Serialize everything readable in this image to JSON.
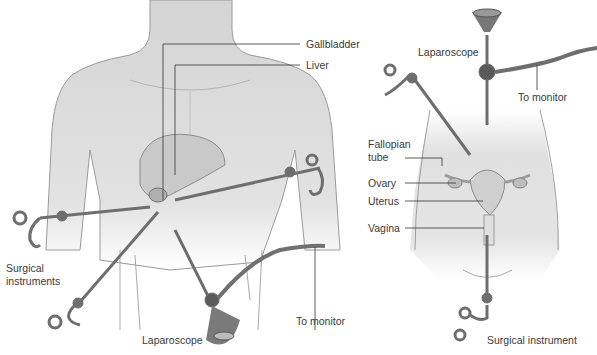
{
  "left_panel": {
    "labels": {
      "gallbladder": "Gallbladder",
      "liver": "Liver",
      "surgical_instruments_line1": "Surgical",
      "surgical_instruments_line2": "instruments",
      "laparoscope": "Laparoscope",
      "to_monitor": "To monitor"
    }
  },
  "right_panel": {
    "labels": {
      "laparoscope": "Laparoscope",
      "to_monitor": "To monitor",
      "fallopian_tube_line1": "Fallopian",
      "fallopian_tube_line2": "tube",
      "ovary": "Ovary",
      "uterus": "Uterus",
      "vagina": "Vagina",
      "surgical_instrument": "Surgical instrument"
    }
  },
  "colors": {
    "skin": "#dcdcdc",
    "outline": "#8a8a8a",
    "instrument": "#6e6e6e",
    "leader_line": "#333333",
    "text": "#3a3a3a"
  }
}
